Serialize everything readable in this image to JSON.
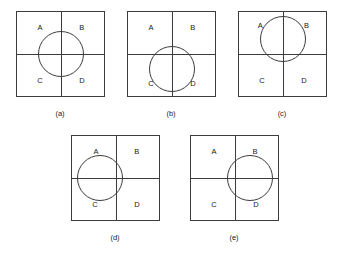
{
  "sheet": {
    "title": "Quadrant circle position figures",
    "background_color": "#ffffff",
    "stroke_color": "#3c3c3c",
    "text_color": "#1a1a1a",
    "width": 346,
    "height": 254
  },
  "quadrant_labels": {
    "top_left": "A",
    "top_right": "B",
    "bottom_left": "C",
    "bottom_right": "D"
  },
  "figures": [
    {
      "id": "a",
      "caption": "(a)",
      "box": {
        "x": 16,
        "y": 11,
        "w": 89,
        "h": 86
      },
      "divider_x_pct": 50,
      "divider_y_pct": 50,
      "circle": {
        "cx_pct": 50,
        "cy_pct": 50,
        "d": 46
      },
      "circle_position": "centered at intersection",
      "labels": {
        "A": {
          "x_pct": 27,
          "y_pct": 20
        },
        "B": {
          "x_pct": 74,
          "y_pct": 20
        },
        "C": {
          "x_pct": 27,
          "y_pct": 81
        },
        "D": {
          "x_pct": 74,
          "y_pct": 81
        }
      },
      "caption_pos": {
        "x": 60,
        "y": 110
      }
    },
    {
      "id": "b",
      "caption": "(b)",
      "box": {
        "x": 127,
        "y": 11,
        "w": 89,
        "h": 86
      },
      "divider_x_pct": 50,
      "divider_y_pct": 50,
      "circle": {
        "cx_pct": 50,
        "cy_pct": 67,
        "d": 46
      },
      "circle_position": "shifted down",
      "labels": {
        "A": {
          "x_pct": 27,
          "y_pct": 20
        },
        "B": {
          "x_pct": 74,
          "y_pct": 20
        },
        "C": {
          "x_pct": 27,
          "y_pct": 85
        },
        "D": {
          "x_pct": 74,
          "y_pct": 85
        }
      },
      "caption_pos": {
        "x": 171,
        "y": 110
      }
    },
    {
      "id": "c",
      "caption": "(c)",
      "box": {
        "x": 238,
        "y": 11,
        "w": 89,
        "h": 86
      },
      "divider_x_pct": 50,
      "divider_y_pct": 50,
      "circle": {
        "cx_pct": 50,
        "cy_pct": 33,
        "d": 46
      },
      "circle_position": "shifted up",
      "labels": {
        "A": {
          "x_pct": 25,
          "y_pct": 18
        },
        "B": {
          "x_pct": 77,
          "y_pct": 18
        },
        "C": {
          "x_pct": 27,
          "y_pct": 81
        },
        "D": {
          "x_pct": 74,
          "y_pct": 81
        }
      },
      "caption_pos": {
        "x": 282,
        "y": 110
      }
    },
    {
      "id": "d",
      "caption": "(d)",
      "box": {
        "x": 71,
        "y": 135,
        "w": 89,
        "h": 86
      },
      "divider_x_pct": 50,
      "divider_y_pct": 50,
      "circle": {
        "cx_pct": 33,
        "cy_pct": 50,
        "d": 46
      },
      "circle_position": "shifted left",
      "labels": {
        "A": {
          "x_pct": 28,
          "y_pct": 20
        },
        "B": {
          "x_pct": 74,
          "y_pct": 20
        },
        "C": {
          "x_pct": 27,
          "y_pct": 81
        },
        "D": {
          "x_pct": 74,
          "y_pct": 81
        }
      },
      "caption_pos": {
        "x": 115,
        "y": 234
      }
    },
    {
      "id": "e",
      "caption": "(e)",
      "box": {
        "x": 190,
        "y": 135,
        "w": 89,
        "h": 86
      },
      "divider_x_pct": 50,
      "divider_y_pct": 50,
      "circle": {
        "cx_pct": 67,
        "cy_pct": 50,
        "d": 46
      },
      "circle_position": "shifted right",
      "labels": {
        "A": {
          "x_pct": 27,
          "y_pct": 20
        },
        "B": {
          "x_pct": 73,
          "y_pct": 20
        },
        "C": {
          "x_pct": 27,
          "y_pct": 81
        },
        "D": {
          "x_pct": 74,
          "y_pct": 81
        }
      },
      "caption_pos": {
        "x": 234,
        "y": 234
      }
    }
  ]
}
